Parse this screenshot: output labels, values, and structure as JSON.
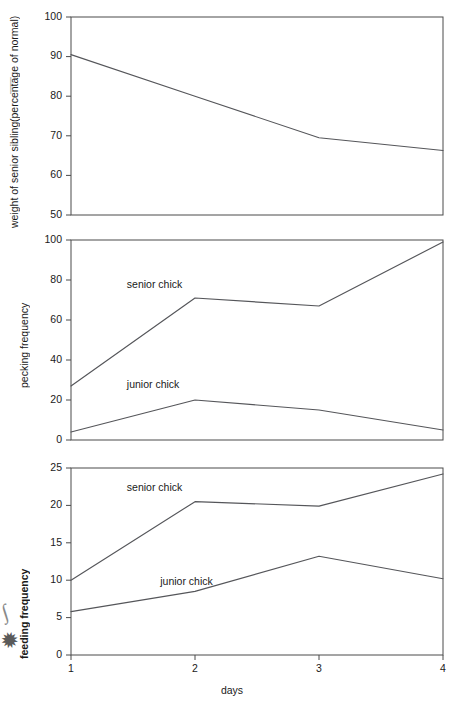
{
  "figure": {
    "xlabel": "days",
    "x_categories": [
      "1",
      "2",
      "3",
      "4"
    ],
    "x_values": [
      1,
      2,
      3,
      4
    ],
    "scan_marks": {
      "squiggle": "∫",
      "star": "✹",
      "top_tick": "│"
    }
  },
  "panels": {
    "top": {
      "ylabel_line1": "weight of senior sibling",
      "ylabel_line2": "(percentage of normal)",
      "yticks": [
        "100",
        "90",
        "80",
        "70",
        "60",
        "50"
      ],
      "series_labels": []
    },
    "middle": {
      "ylabel": "pecking frequency",
      "yticks": [
        "100",
        "80",
        "60",
        "40",
        "20",
        "0"
      ],
      "series_labels": [
        "senior chick",
        "junior chick"
      ]
    },
    "bottom": {
      "ylabel": "feeding frequency",
      "yticks": [
        "25",
        "20",
        "15",
        "10",
        "5",
        "0"
      ],
      "series_labels": [
        "senior chick",
        "junior chick"
      ]
    }
  },
  "chart_data": [
    {
      "type": "line",
      "id": "weight-of-senior-sibling",
      "title": "",
      "xlabel": "days",
      "ylabel": "weight of senior sibling (percentage of normal)",
      "x": [
        1,
        2,
        3,
        4
      ],
      "xtick_labels": [
        "1",
        "2",
        "3",
        "4"
      ],
      "xlim": [
        1,
        4
      ],
      "ylim": [
        50,
        100
      ],
      "ytick_labels": [
        "50",
        "60",
        "70",
        "80",
        "90",
        "100"
      ],
      "yticks": [
        50,
        60,
        70,
        80,
        90,
        100
      ],
      "grid": false,
      "legend": "none",
      "series": [
        {
          "name": "weight of senior sibling",
          "label_in_plot": "",
          "values": [
            90.5,
            80.0,
            69.5,
            66.3
          ],
          "color": "#55565a"
        }
      ]
    },
    {
      "type": "line",
      "id": "pecking-frequency",
      "title": "",
      "xlabel": "days",
      "ylabel": "pecking frequency",
      "x": [
        1,
        2,
        3,
        4
      ],
      "xtick_labels": [
        "1",
        "2",
        "3",
        "4"
      ],
      "xlim": [
        1,
        4
      ],
      "ylim": [
        0,
        100
      ],
      "ytick_labels": [
        "0",
        "20",
        "40",
        "60",
        "80",
        "100"
      ],
      "yticks": [
        0,
        20,
        40,
        60,
        80,
        100
      ],
      "grid": false,
      "legend": "in-plot labels",
      "series": [
        {
          "name": "senior chick",
          "label_in_plot": "senior chick",
          "values": [
            27,
            71,
            67,
            99
          ],
          "color": "#55565a"
        },
        {
          "name": "junior chick",
          "label_in_plot": "junior chick",
          "values": [
            4,
            20,
            15,
            5
          ],
          "color": "#55565a"
        }
      ]
    },
    {
      "type": "line",
      "id": "feeding-frequency",
      "title": "",
      "xlabel": "days",
      "ylabel": "feeding frequency",
      "x": [
        1,
        2,
        3,
        4
      ],
      "xtick_labels": [
        "1",
        "2",
        "3",
        "4"
      ],
      "xlim": [
        1,
        4
      ],
      "ylim": [
        0,
        25
      ],
      "ytick_labels": [
        "0",
        "5",
        "10",
        "15",
        "20",
        "25"
      ],
      "yticks": [
        0,
        5,
        10,
        15,
        20,
        25
      ],
      "grid": false,
      "legend": "in-plot labels",
      "series": [
        {
          "name": "senior chick",
          "label_in_plot": "senior chick",
          "values": [
            10.0,
            20.5,
            19.9,
            24.2
          ],
          "color": "#55565a"
        },
        {
          "name": "junior chick",
          "label_in_plot": "junior chick",
          "values": [
            5.8,
            8.5,
            13.2,
            10.2
          ],
          "color": "#55565a"
        }
      ]
    }
  ]
}
